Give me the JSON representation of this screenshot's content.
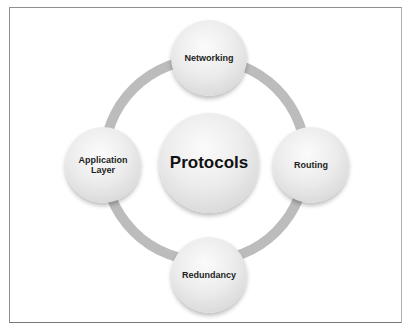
{
  "diagram": {
    "center": {
      "label": "Protocols"
    },
    "nodes": [
      {
        "label": "Networking",
        "position": "top"
      },
      {
        "label": "Routing",
        "position": "right"
      },
      {
        "label": "Redundancy",
        "position": "bottom"
      },
      {
        "label": "Application Layer",
        "position": "left"
      }
    ],
    "colors": {
      "ring": "#bcbcbc",
      "node_fill": "#e6e6e6",
      "text": "#1e1e1e",
      "frame": "#8f8f8f"
    }
  }
}
